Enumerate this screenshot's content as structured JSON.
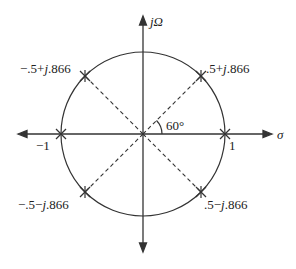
{
  "diagram": {
    "type": "s-plane pole plot",
    "axes": {
      "horizontal_label": "σ",
      "vertical_label": "jΩ"
    },
    "circle": {
      "radius_label_right": "1",
      "radius_label_left": "−1"
    },
    "angle_label": "60°",
    "poles": [
      {
        "id": "p1",
        "label_pre": ".5+",
        "label_j": "j",
        "label_post": ".866",
        "re": 0.5,
        "im": 0.866
      },
      {
        "id": "p2",
        "label_pre": "−.5+",
        "label_j": "j",
        "label_post": ".866",
        "re": -0.5,
        "im": 0.866
      },
      {
        "id": "p3",
        "label_pre": "−.5−",
        "label_j": "j",
        "label_post": ".866",
        "re": -0.5,
        "im": -0.866
      },
      {
        "id": "p4",
        "label_pre": ".5−",
        "label_j": "j",
        "label_post": ".866",
        "re": 0.5,
        "im": -0.866
      },
      {
        "id": "p5",
        "re": 1,
        "im": 0
      },
      {
        "id": "p6",
        "re": -1,
        "im": 0
      }
    ],
    "colors": {
      "line": "#333333",
      "text": "#222222"
    }
  }
}
